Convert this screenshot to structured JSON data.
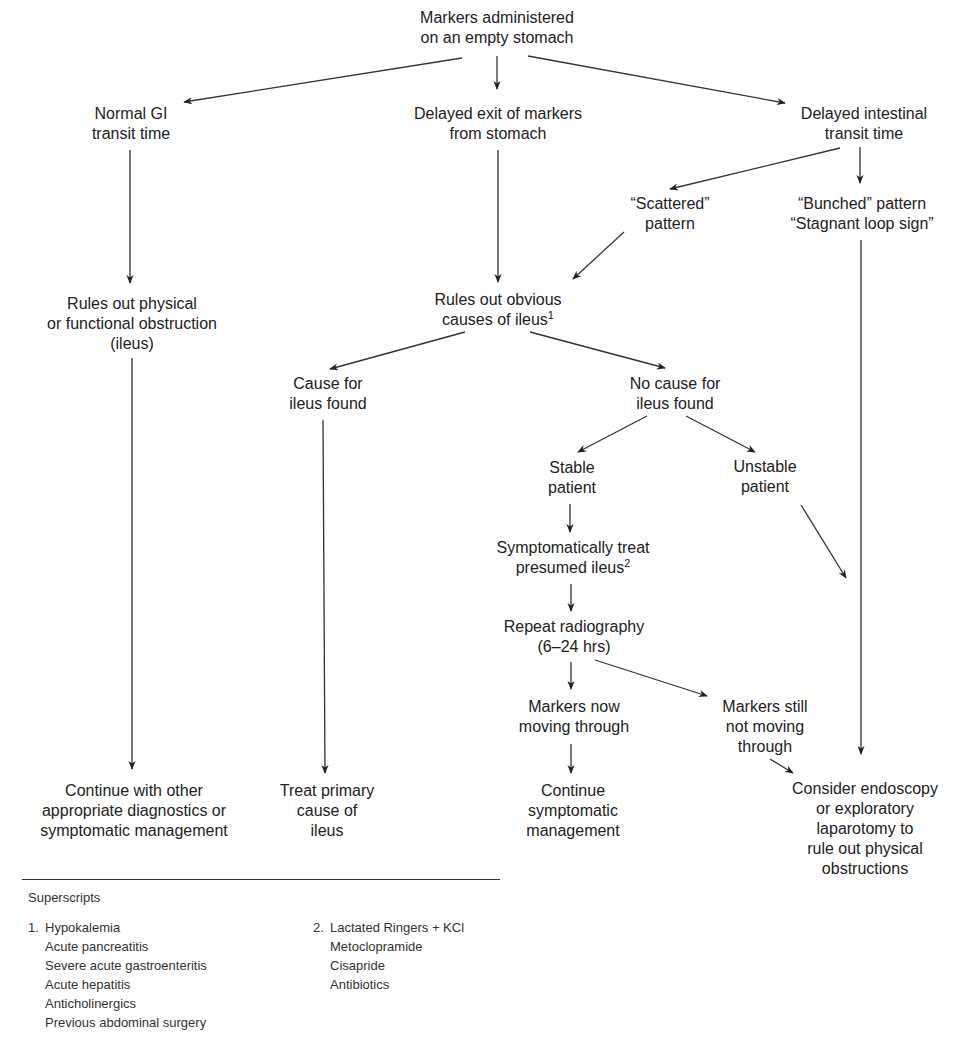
{
  "diagram": {
    "nodes": {
      "start": {
        "lines": [
          "Markers administered",
          "on an empty stomach"
        ]
      },
      "normal_gi": {
        "lines": [
          "Normal GI",
          "transit time"
        ]
      },
      "delayed_exit": {
        "lines": [
          "Delayed exit of markers",
          "from stomach"
        ]
      },
      "delayed_intestinal": {
        "lines": [
          "Delayed intestinal",
          "transit time"
        ]
      },
      "scattered": {
        "lines": [
          "“Scattered”",
          "pattern"
        ]
      },
      "bunched": {
        "lines": [
          "“Bunched” pattern",
          "“Stagnant loop sign”"
        ]
      },
      "rules_out_physical": {
        "lines": [
          "Rules out physical",
          "or functional obstruction",
          "(ileus)"
        ]
      },
      "rules_out_obvious": {
        "lines": [
          "Rules out obvious",
          "causes of ileus"
        ],
        "superscript": "1"
      },
      "cause_found": {
        "lines": [
          "Cause for",
          "ileus found"
        ]
      },
      "no_cause": {
        "lines": [
          "No cause for",
          "ileus found"
        ]
      },
      "stable": {
        "lines": [
          "Stable",
          "patient"
        ]
      },
      "unstable": {
        "lines": [
          "Unstable",
          "patient"
        ]
      },
      "symptomatic_treat": {
        "lines": [
          "Symptomatically treat",
          "presumed ileus"
        ],
        "superscript": "2"
      },
      "repeat_radiography": {
        "lines": [
          "Repeat radiography",
          "(6–24 hrs)"
        ]
      },
      "markers_moving": {
        "lines": [
          "Markers now",
          "moving through"
        ]
      },
      "markers_not_moving": {
        "lines": [
          "Markers still",
          "not moving",
          "through"
        ]
      },
      "continue_other": {
        "lines": [
          "Continue with other",
          "appropriate diagnostics or",
          "symptomatic management"
        ]
      },
      "treat_primary": {
        "lines": [
          "Treat primary",
          "cause of",
          "ileus"
        ]
      },
      "continue_symptomatic": {
        "lines": [
          "Continue",
          "symptomatic",
          "management"
        ]
      },
      "consider_endoscopy": {
        "lines": [
          "Consider endoscopy",
          "or exploratory",
          "laparotomy to",
          "rule out physical",
          "obstructions"
        ]
      }
    },
    "edges": [
      {
        "from": "start",
        "to": "normal_gi"
      },
      {
        "from": "start",
        "to": "delayed_exit"
      },
      {
        "from": "start",
        "to": "delayed_intestinal"
      },
      {
        "from": "normal_gi",
        "to": "rules_out_physical"
      },
      {
        "from": "delayed_exit",
        "to": "rules_out_obvious"
      },
      {
        "from": "delayed_intestinal",
        "to": "scattered"
      },
      {
        "from": "delayed_intestinal",
        "to": "bunched"
      },
      {
        "from": "scattered",
        "to": "rules_out_obvious"
      },
      {
        "from": "bunched",
        "to": "consider_endoscopy"
      },
      {
        "from": "rules_out_physical",
        "to": "continue_other"
      },
      {
        "from": "rules_out_obvious",
        "to": "cause_found"
      },
      {
        "from": "rules_out_obvious",
        "to": "no_cause"
      },
      {
        "from": "cause_found",
        "to": "treat_primary"
      },
      {
        "from": "no_cause",
        "to": "stable"
      },
      {
        "from": "no_cause",
        "to": "unstable"
      },
      {
        "from": "unstable",
        "to": "consider_endoscopy"
      },
      {
        "from": "stable",
        "to": "symptomatic_treat"
      },
      {
        "from": "symptomatic_treat",
        "to": "repeat_radiography"
      },
      {
        "from": "repeat_radiography",
        "to": "markers_moving"
      },
      {
        "from": "repeat_radiography",
        "to": "markers_not_moving"
      },
      {
        "from": "markers_moving",
        "to": "continue_symptomatic"
      },
      {
        "from": "markers_not_moving",
        "to": "consider_endoscopy"
      }
    ]
  },
  "notes": {
    "title": "Superscripts",
    "groups": [
      {
        "number": "1.",
        "items": [
          "Hypokalemia",
          "Acute pancreatitis",
          "Severe acute gastroenteritis",
          "Acute hepatitis",
          "Anticholinergics",
          "Previous abdominal surgery"
        ]
      },
      {
        "number": "2.",
        "items": [
          "Lactated Ringers + KCl",
          "Metoclopramide",
          "Cisapride",
          "Antibiotics"
        ]
      }
    ]
  },
  "colors": {
    "text": "#222222",
    "line": "#333333",
    "background": "#ffffff"
  }
}
